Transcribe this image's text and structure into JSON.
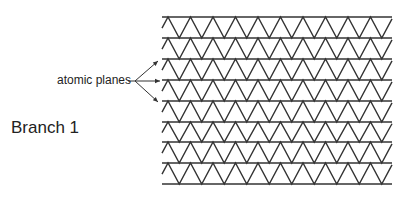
{
  "labels": {
    "atomic_planes": "atomic planes",
    "branch": "Branch 1"
  },
  "lattice": {
    "left": 162,
    "right": 392,
    "plane_y": [
      17,
      38,
      59,
      80,
      101,
      122,
      142,
      163,
      184
    ],
    "period": 22.5,
    "first_peak_x": 168,
    "stroke": "#333333"
  },
  "arrows": {
    "origin": [
      135,
      81
    ],
    "targets": [
      [
        158,
        61
      ],
      [
        160,
        81
      ],
      [
        158,
        102
      ]
    ]
  }
}
